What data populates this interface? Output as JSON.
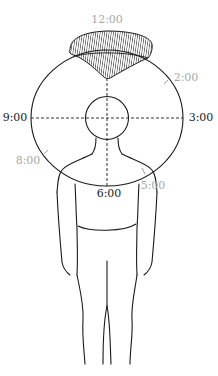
{
  "diagram": {
    "title": "",
    "colors": {
      "line": "#1a1a1a",
      "primary_label": "#222222",
      "secondary_label": "#a8a8a8",
      "hatch": "#2a2a2a"
    },
    "labels": {
      "twelve": "12:00",
      "two": "2:00",
      "three": "3:00",
      "five": "5:00",
      "six": "6:00",
      "eight": "8:00",
      "nine": "9:00"
    },
    "elements": {
      "outer_circle": "clock circle centered on head",
      "head_circle": "head outline",
      "crosshair": "dashed horizontal and vertical axes through center",
      "hatched_region": "hatched lesion/area at 12:00 position",
      "body": "human figure outline, front view"
    }
  }
}
